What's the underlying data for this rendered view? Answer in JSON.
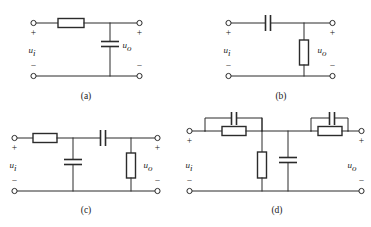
{
  "figure": {
    "background_color": "#ffffff",
    "line_color": "#2b2b2b",
    "panels": [
      {
        "id": "a",
        "caption": "(a)",
        "input_label": "u",
        "input_sub": "i",
        "output_label": "u",
        "output_sub": "o",
        "plus_left": "+",
        "minus_left": "−",
        "plus_right": "+",
        "minus_right": "−",
        "topology": "series resistor, shunt capacitor (low-pass)",
        "components": [
          {
            "name": "series-resistor",
            "type": "resistor",
            "orientation": "horizontal"
          },
          {
            "name": "shunt-capacitor",
            "type": "capacitor",
            "orientation": "vertical"
          }
        ]
      },
      {
        "id": "b",
        "caption": "(b)",
        "input_label": "u",
        "input_sub": "i",
        "output_label": "u",
        "output_sub": "o",
        "plus_left": "+",
        "minus_left": "−",
        "plus_right": "+",
        "minus_right": "−",
        "topology": "series capacitor, shunt resistor (high-pass)",
        "components": [
          {
            "name": "series-capacitor",
            "type": "capacitor",
            "orientation": "horizontal"
          },
          {
            "name": "shunt-resistor",
            "type": "resistor",
            "orientation": "vertical"
          }
        ]
      },
      {
        "id": "c",
        "caption": "(c)",
        "input_label": "u",
        "input_sub": "i",
        "output_label": "u",
        "output_sub": "o",
        "plus_left": "+",
        "minus_left": "−",
        "plus_right": "+",
        "minus_right": "−",
        "topology": "series resistor, shunt capacitor, series capacitor, shunt resistor (band-pass)",
        "components": [
          {
            "name": "series-resistor-1",
            "type": "resistor",
            "orientation": "horizontal"
          },
          {
            "name": "shunt-capacitor-1",
            "type": "capacitor",
            "orientation": "vertical"
          },
          {
            "name": "series-capacitor-2",
            "type": "capacitor",
            "orientation": "horizontal"
          },
          {
            "name": "shunt-resistor-2",
            "type": "resistor",
            "orientation": "vertical"
          }
        ]
      },
      {
        "id": "d",
        "caption": "(d)",
        "input_label": "u",
        "input_sub": "i",
        "output_label": "u",
        "output_sub": "o",
        "plus_left": "+",
        "minus_left": "−",
        "plus_right": "+",
        "minus_right": "−",
        "topology": "two parallel RC series blocks with shunt resistor and shunt capacitor (double-T / bridged network)",
        "components": [
          {
            "name": "series-rc-block-1-capacitor",
            "type": "capacitor",
            "orientation": "horizontal"
          },
          {
            "name": "series-rc-block-1-resistor",
            "type": "resistor",
            "orientation": "horizontal"
          },
          {
            "name": "shunt-resistor-mid",
            "type": "resistor",
            "orientation": "vertical"
          },
          {
            "name": "shunt-capacitor-mid",
            "type": "capacitor",
            "orientation": "vertical"
          },
          {
            "name": "series-rc-block-2-capacitor",
            "type": "capacitor",
            "orientation": "horizontal"
          },
          {
            "name": "series-rc-block-2-resistor",
            "type": "resistor",
            "orientation": "horizontal"
          }
        ]
      }
    ]
  }
}
